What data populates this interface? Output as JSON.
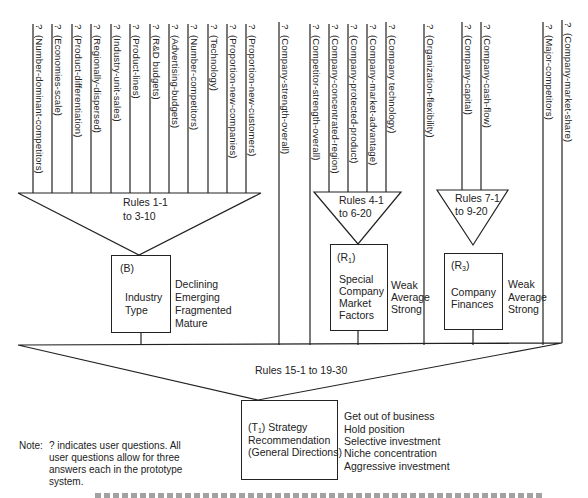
{
  "diagram": {
    "question_marker": "?",
    "industry_questions": [
      "(Number-dominant-competitors)",
      "(Economies-scale)",
      "(Product-differentiation)",
      "(Regionally-dispersed)",
      "(Industry-unit-sales)",
      "(Product-lines)",
      "(R&D budgets)",
      "(Advertising-budgets)",
      "(Number-competitors)",
      "(Technology)",
      "(Proportion-new-companies)",
      "(Proportion-new-customers)"
    ],
    "direct_question_1": "(Company-strength-overall)",
    "market_questions": [
      "(Competitor-strength-overall)",
      "(Company-concentrated-region)",
      "(Company-protected-product)",
      "(Company-market-advantage)",
      "(Company technology)"
    ],
    "direct_question_2": "(Organization-flexibility)",
    "finance_questions": [
      "(Company-capital)",
      "(Company-cash-flow)"
    ],
    "direct_question_3": "(Major-competitors)",
    "direct_question_4": "(Company-market-share)",
    "rules_industry": [
      "Rules 1-1",
      "to 3-10"
    ],
    "rules_market": [
      "Rules 4-1",
      "to 6-20"
    ],
    "rules_finance": [
      "Rules 7-1",
      "to 9-20"
    ],
    "rules_strategy": "Rules 15-1 to 19-30",
    "industry_box": {
      "code": "(B)",
      "title": [
        "Industry",
        "Type"
      ],
      "values": [
        "Declining",
        "Emerging",
        "Fragmented",
        "Mature"
      ]
    },
    "market_box": {
      "code_prefix": "(R",
      "code_sub": "1",
      "code_suffix": ")",
      "title": [
        "Special",
        "Company",
        "Market",
        "Factors"
      ],
      "values": [
        "Weak",
        "Average",
        "Strong"
      ]
    },
    "finance_box": {
      "code_prefix": "(R",
      "code_sub": "3",
      "code_suffix": ")",
      "title": [
        "Company",
        "Finances"
      ],
      "values": [
        "Weak",
        "Average",
        "Strong"
      ]
    },
    "strategy_box": {
      "code_prefix": "(T",
      "code_sub": "1",
      "code_suffix": ") Strategy",
      "title": [
        "Recommendation",
        "(General Directions)"
      ],
      "values": [
        "Get out of business",
        "Hold position",
        "Selective investment",
        "Niche concentration",
        "Aggressive investment"
      ]
    },
    "note": {
      "label": "Note:",
      "lines": [
        "? indicates user questions. All",
        "user questions allow for three",
        "answers each in the prototype",
        "system."
      ]
    }
  }
}
